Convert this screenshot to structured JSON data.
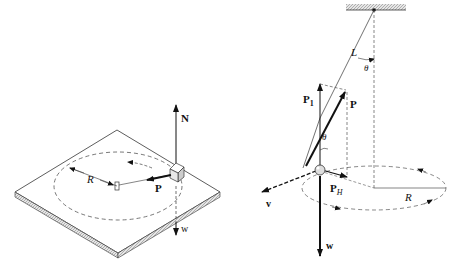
{
  "left_figure": {
    "description": "Block on rotating turntable",
    "labels": {
      "normal_force": "N",
      "weight": "w",
      "centripetal_force": "P",
      "radius": "R"
    }
  },
  "right_figure": {
    "description": "Conical pendulum",
    "labels": {
      "length": "L",
      "angle_top": "θ",
      "angle_bob": "θ",
      "tension": "P",
      "vertical_component": "P",
      "vertical_component_sub": "1",
      "horizontal_component": "P",
      "horizontal_component_sub": "H",
      "velocity": "v",
      "weight": "w",
      "radius": "R"
    }
  }
}
